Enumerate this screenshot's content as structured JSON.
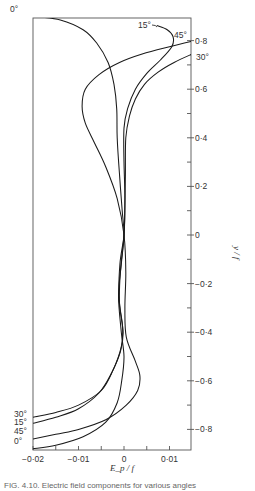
{
  "chart_data": {
    "type": "line",
    "title": "",
    "xlabel": "E_p / f",
    "ylabel": "y / f",
    "xlim": [
      -0.02,
      0.015
    ],
    "ylim": [
      -0.92,
      0.95
    ],
    "grid": false,
    "legend": "inline curve labels",
    "x_ticks": [
      -0.02,
      -0.015,
      -0.01,
      -0.005,
      0,
      0.005,
      0.01
    ],
    "x_tick_labels": [
      {
        "value": -0.02,
        "label": "−0·02"
      },
      {
        "value": -0.01,
        "label": "−0·01"
      },
      {
        "value": 0,
        "label": "0"
      },
      {
        "value": 0.01,
        "label": "0·01"
      }
    ],
    "y_ticks": [
      0.8,
      0.7,
      0.6,
      0.5,
      0.4,
      0.3,
      0.2,
      0.1,
      0,
      -0.1,
      -0.2,
      -0.3,
      -0.4,
      -0.5,
      -0.6,
      -0.7,
      -0.8
    ],
    "y_tick_labels": [
      {
        "value": 0.8,
        "label": "0·8"
      },
      {
        "value": 0.6,
        "label": "0·6"
      },
      {
        "value": 0.4,
        "label": "0·4"
      },
      {
        "value": 0.2,
        "label": "0·2"
      },
      {
        "value": 0,
        "label": "0"
      },
      {
        "value": -0.2,
        "label": "−0·2"
      },
      {
        "value": -0.4,
        "label": "−0·4"
      },
      {
        "value": -0.6,
        "label": "−0·6"
      },
      {
        "value": -0.8,
        "label": "−0·8"
      }
    ],
    "series": [
      {
        "name": "0°",
        "top_label": {
          "text": "0°",
          "x": 10,
          "y": 12
        },
        "bottom_label": {
          "text": "0°",
          "x": 14,
          "y": 444
        },
        "points": [
          [
            -0.02,
            0.9
          ],
          [
            -0.014,
            0.885
          ],
          [
            -0.009,
            0.845
          ],
          [
            -0.006,
            0.79
          ],
          [
            -0.0035,
            0.71
          ],
          [
            -0.0022,
            0.62
          ],
          [
            -0.0016,
            0.52
          ],
          [
            -0.0015,
            0.4
          ],
          [
            -0.001,
            0.25
          ],
          [
            -0.0004,
            0.1
          ],
          [
            0,
            0
          ],
          [
            -0.0006,
            -0.12
          ],
          [
            -0.0012,
            -0.25
          ],
          [
            -0.0006,
            -0.4
          ],
          [
            0,
            -0.5
          ],
          [
            -0.0005,
            -0.6
          ],
          [
            -0.0015,
            -0.69
          ],
          [
            -0.004,
            -0.77
          ],
          [
            -0.009,
            -0.83
          ],
          [
            -0.015,
            -0.865
          ],
          [
            -0.02,
            -0.88
          ]
        ]
      },
      {
        "name": "15°",
        "top_label": {
          "text": "15°",
          "x": 138,
          "y": 28
        },
        "bottom_label": {
          "text": "15°",
          "x": 14,
          "y": 425
        },
        "points": [
          [
            0.0072,
            0.862
          ],
          [
            0.0095,
            0.845
          ],
          [
            0.0108,
            0.815
          ],
          [
            0.0105,
            0.775
          ],
          [
            0.008,
            0.72
          ],
          [
            0.005,
            0.665
          ],
          [
            0.0025,
            0.6
          ],
          [
            0.0008,
            0.52
          ],
          [
            0,
            0.44
          ],
          [
            0,
            0.3
          ],
          [
            0.0002,
            0.15
          ],
          [
            0,
            0
          ],
          [
            -0.0008,
            -0.15
          ],
          [
            -0.001,
            -0.28
          ],
          [
            -0.0002,
            -0.4
          ],
          [
            -0.0008,
            -0.48
          ],
          [
            -0.0028,
            -0.57
          ],
          [
            -0.0055,
            -0.65
          ],
          [
            -0.01,
            -0.715
          ],
          [
            -0.015,
            -0.75
          ],
          [
            -0.02,
            -0.775
          ]
        ]
      },
      {
        "name": "30°",
        "top_label": {
          "text": "30°",
          "x": 196,
          "y": 60
        },
        "bottom_label": {
          "text": "30°",
          "x": 14,
          "y": 417
        },
        "points": [
          [
            0.015,
            0.745
          ],
          [
            0.011,
            0.71
          ],
          [
            0.0075,
            0.67
          ],
          [
            0.0045,
            0.62
          ],
          [
            0.0025,
            0.56
          ],
          [
            0.0012,
            0.49
          ],
          [
            0.0004,
            0.4
          ],
          [
            0.0003,
            0.25
          ],
          [
            0.0002,
            0.12
          ],
          [
            0,
            0
          ],
          [
            -0.0009,
            -0.12
          ],
          [
            -0.0011,
            -0.26
          ],
          [
            -0.0003,
            -0.38
          ],
          [
            -0.0006,
            -0.46
          ],
          [
            -0.0025,
            -0.56
          ],
          [
            -0.005,
            -0.64
          ],
          [
            -0.01,
            -0.7
          ],
          [
            -0.015,
            -0.73
          ],
          [
            -0.02,
            -0.75
          ]
        ]
      },
      {
        "name": "45°",
        "top_label": {
          "text": "45°",
          "x": 174,
          "y": 38
        },
        "bottom_label": {
          "text": "45°",
          "x": 14,
          "y": 434
        },
        "points": [
          [
            0.015,
            0.798
          ],
          [
            0.01,
            0.775
          ],
          [
            0.004,
            0.745
          ],
          [
            -0.001,
            0.71
          ],
          [
            -0.0055,
            0.66
          ],
          [
            -0.0085,
            0.6
          ],
          [
            -0.0092,
            0.53
          ],
          [
            -0.0085,
            0.46
          ],
          [
            -0.0065,
            0.38
          ],
          [
            -0.004,
            0.28
          ],
          [
            -0.0015,
            0.15
          ],
          [
            0,
            0
          ],
          [
            0.0004,
            -0.15
          ],
          [
            0.0002,
            -0.3
          ],
          [
            0.0005,
            -0.42
          ],
          [
            0.0025,
            -0.52
          ],
          [
            0.0035,
            -0.58
          ],
          [
            0.003,
            -0.64
          ],
          [
            0.0005,
            -0.7
          ],
          [
            -0.004,
            -0.76
          ],
          [
            -0.01,
            -0.8
          ],
          [
            -0.015,
            -0.82
          ],
          [
            -0.02,
            -0.84
          ]
        ]
      }
    ]
  },
  "figure": {
    "caption": "FIG. 4.10. Electric field components for various angles"
  }
}
